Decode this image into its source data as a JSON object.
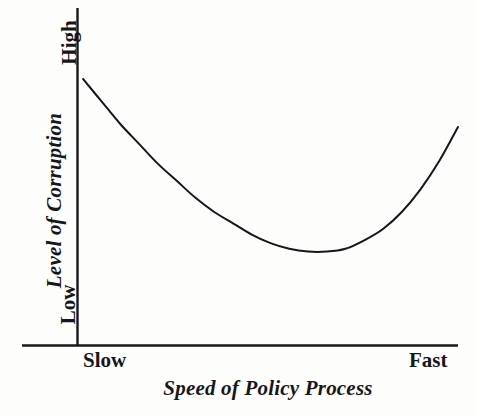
{
  "figure": {
    "background_color": "#fdfdfc",
    "ink_color": "#17171a"
  },
  "chart_data": {
    "type": "line",
    "title": "",
    "subtitle": "",
    "xlabel": "Speed of Policy Process",
    "ylabel": "Level of Corruption",
    "x_tick_labels": [
      "Slow",
      "Fast"
    ],
    "y_tick_labels": [
      "Low",
      "High"
    ],
    "xlim": [
      0,
      1
    ],
    "ylim": [
      0,
      1
    ],
    "grid": false,
    "legend": null,
    "annotations": [],
    "series": [
      {
        "name": "Corruption vs policy speed",
        "description": "U-shaped (convex) curve: corruption is high when the policy process is very slow, falls to a minimum at a moderate speed, then rises again as the process becomes very fast.",
        "color": "#17171a",
        "line_width": 2,
        "x": [
          0.0,
          0.05,
          0.1,
          0.15,
          0.2,
          0.25,
          0.3,
          0.35,
          0.4,
          0.45,
          0.5,
          0.55,
          0.6,
          0.65,
          0.7,
          0.75,
          0.8,
          0.85,
          0.9,
          0.95,
          1.0
        ],
        "y": [
          0.94,
          0.86,
          0.78,
          0.71,
          0.64,
          0.58,
          0.52,
          0.47,
          0.43,
          0.39,
          0.36,
          0.34,
          0.33,
          0.33,
          0.34,
          0.37,
          0.41,
          0.47,
          0.55,
          0.65,
          0.77
        ],
        "minimum_point": {
          "x": 0.6,
          "y": 0.33
        }
      }
    ],
    "axes": {
      "x_axis_drawn": true,
      "y_axis_drawn": true,
      "x_axis_extends_left_of_origin": true,
      "ticks_drawn": false
    }
  },
  "labels": {
    "y_axis_title": "Level of Corruption",
    "y_tick_high": "High",
    "y_tick_low": "Low",
    "x_tick_slow": "Slow",
    "x_tick_fast": "Fast",
    "x_axis_title": "Speed of Policy Process"
  }
}
